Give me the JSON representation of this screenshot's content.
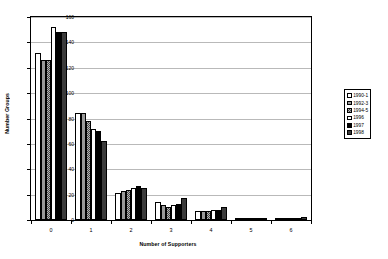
{
  "chart_data": {
    "type": "bar",
    "title": "",
    "xlabel": "Number of Supporters",
    "ylabel": "Number Groups",
    "categories": [
      "0",
      "1",
      "2",
      "3",
      "4",
      "5",
      "6"
    ],
    "ylim": [
      0,
      160
    ],
    "yticks": [
      0,
      20,
      40,
      60,
      80,
      100,
      120,
      140,
      160
    ],
    "grid": true,
    "legend_position": "right",
    "series": [
      {
        "name": "1990-1",
        "values": [
          132,
          84,
          21,
          14,
          7,
          1,
          1
        ]
      },
      {
        "name": "1992-3",
        "values": [
          126,
          84,
          23,
          12,
          7,
          1,
          1
        ]
      },
      {
        "name": "1994-5",
        "values": [
          126,
          78,
          24,
          10,
          7,
          1,
          1
        ]
      },
      {
        "name": "1996",
        "values": [
          152,
          72,
          25,
          12,
          8,
          1,
          1
        ]
      },
      {
        "name": "1997",
        "values": [
          148,
          70,
          27,
          13,
          8,
          1,
          1
        ]
      },
      {
        "name": "1998",
        "values": [
          148,
          62,
          25,
          17,
          10,
          1,
          2
        ]
      }
    ]
  },
  "legend": {
    "items": [
      {
        "label": "1990-1"
      },
      {
        "label": "1992-3"
      },
      {
        "label": "1994-5"
      },
      {
        "label": "1996"
      },
      {
        "label": "1997"
      },
      {
        "label": "1998"
      }
    ]
  }
}
